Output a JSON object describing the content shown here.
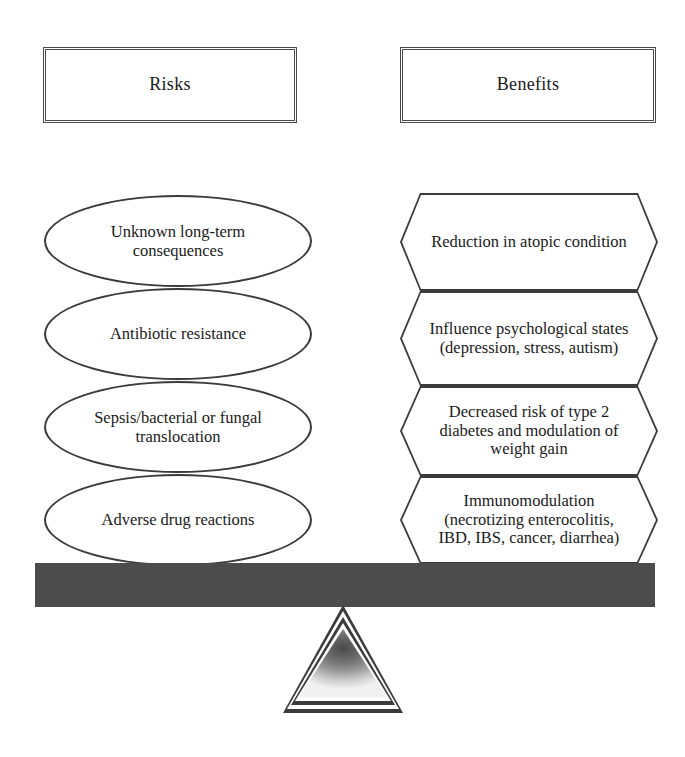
{
  "diagram": {
    "colors": {
      "beam": "#4c4c4c",
      "outline": "#3b3b3b",
      "background": "#ffffff"
    },
    "headers": {
      "risks": "Risks",
      "benefits": "Benefits"
    },
    "risks": [
      {
        "id": "unknown-long-term-consequences",
        "text": "Unknown long-term consequences"
      },
      {
        "id": "antibiotic-resistance",
        "text": "Antibiotic resistance"
      },
      {
        "id": "sepsis-bacterial-or-fungal-translocation",
        "text": "Sepsis/bacterial or fungal translocation"
      },
      {
        "id": "adverse-drug-reactions",
        "text": "Adverse drug reactions"
      }
    ],
    "benefits": [
      {
        "id": "reduction-in-atopic-condition",
        "text": "Reduction in atopic condition"
      },
      {
        "id": "influence-psychological-states",
        "text": "Influence psychological states (depression, stress, autism)"
      },
      {
        "id": "decreased-risk-of-type-2-diabetes",
        "text": "Decreased risk of type 2 diabetes and modulation of weight gain"
      },
      {
        "id": "immunomodulation",
        "text": "Immunomodulation (necrotizing enterocolitis, IBD, IBS, cancer, diarrhea)"
      }
    ],
    "fulcrum": {
      "shape": "triangle-fulcrum"
    },
    "beam": {
      "shape": "balance-beam"
    }
  }
}
